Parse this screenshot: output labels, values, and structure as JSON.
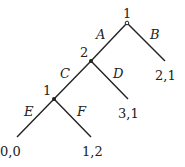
{
  "diagram": {
    "type": "extensive-form game tree",
    "nodes": [
      {
        "id": "root",
        "player": "1",
        "x": 127,
        "y": 22
      },
      {
        "id": "n2",
        "player": "2",
        "x": 91,
        "y": 61
      },
      {
        "id": "n3",
        "player": "1",
        "x": 54,
        "y": 99
      }
    ],
    "actions": {
      "A": "A",
      "B": "B",
      "C": "C",
      "D": "D",
      "E": "E",
      "F": "F"
    },
    "payoffs": {
      "B": "2,1",
      "D": "3,1",
      "E": "0,0",
      "F": "1,2"
    }
  }
}
